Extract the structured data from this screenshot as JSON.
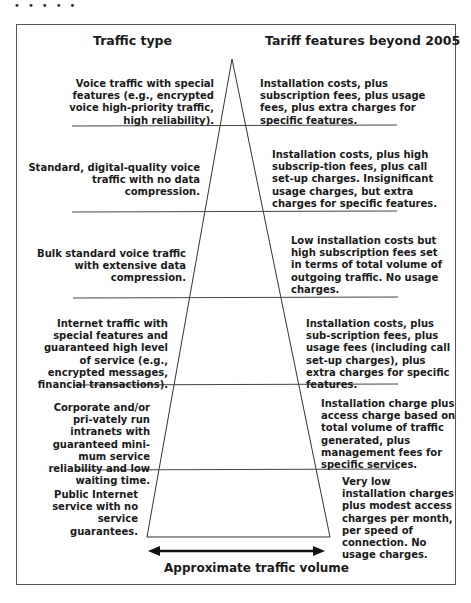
{
  "decoration": {
    "dots": "•••••"
  },
  "headers": {
    "left": "Traffic type",
    "right": "Tariff features beyond 2005"
  },
  "rows": [
    {
      "traffic_type": "Voice traffic with special features (e.g., encrypted voice high-priority traffic, high reliability).",
      "tariff_features": "Installation costs, plus subscription fees, plus usage fees, plus extra charges for specific features."
    },
    {
      "traffic_type": "Standard, digital-quality voice traffic with no data compression.",
      "tariff_features": "Installation costs, plus high subscrip-tion fees, plus call set-up charges. Insignificant usage charges, but extra charges for specific features."
    },
    {
      "traffic_type": "Bulk standard voice traffic with extensive data compression.",
      "tariff_features": "Low installation costs but high subscription fees set in terms of total volume of outgoing traffic. No usage charges."
    },
    {
      "traffic_type": "Internet traffic with special features and guaranteed high level of service (e.g., encrypted messages, financial transactions).",
      "tariff_features": "Installation costs, plus sub-scription fees, plus usage fees (including call set-up charges), plus extra charges for specific features."
    },
    {
      "traffic_type": "Corporate and/or pri-vately run intranets with guaranteed mini-mum service reliability and low waiting time.",
      "tariff_features": "Installation charge plus access charge based on total volume of traffic generated, plus management fees for specific services."
    },
    {
      "traffic_type": "Public Internet service with no service guarantees.",
      "tariff_features": "Very low installation charges plus modest access charges per month, per speed of connection. No usage charges."
    }
  ],
  "axis": {
    "label": "Approximate traffic volume"
  },
  "colors": {
    "line": "#333333",
    "frame": "#555555",
    "text": "#1a1a1a"
  }
}
